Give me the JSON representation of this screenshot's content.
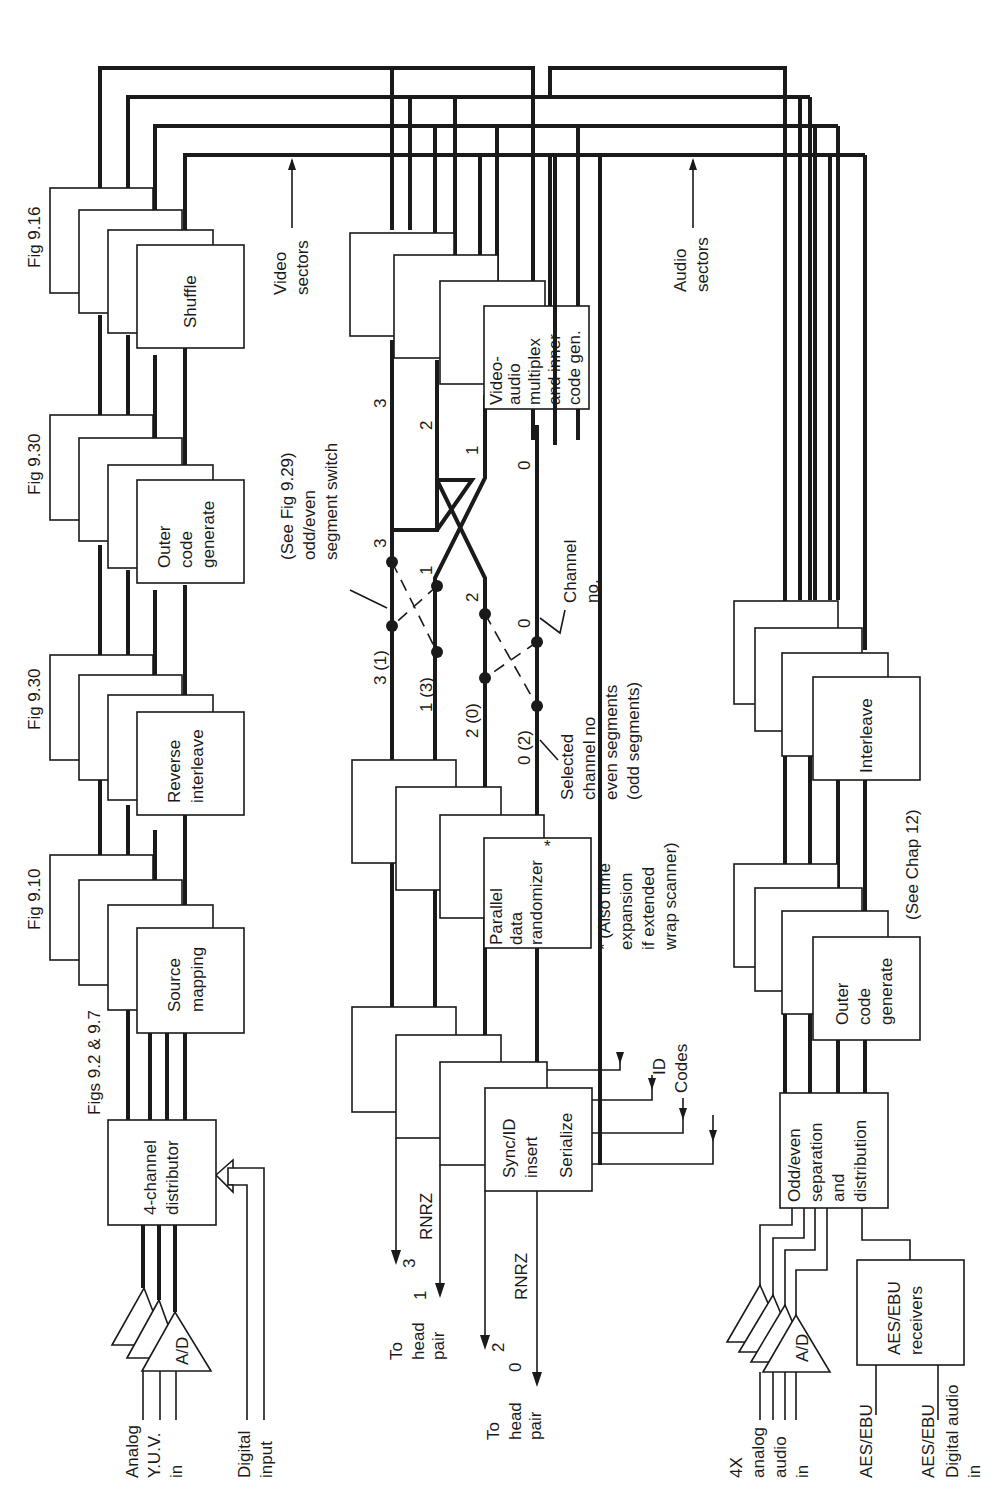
{
  "figure_refs": {
    "distributor": "Figs 9.2 & 9.7",
    "source_mapping": "Fig 9.10",
    "reverse_interleave": "Fig 9.30",
    "outer_code": "Fig 9.30",
    "shuffle": "Fig 9.16"
  },
  "video_chain": {
    "inputs": {
      "analog_line1": "Analog",
      "analog_line2": "Y.U.V.",
      "analog_line3": "in",
      "digital_line1": "Digital",
      "digital_line2": "input"
    },
    "adc_label": "A/D",
    "distributor": {
      "line1": "4-channel",
      "line2": "distributor"
    },
    "source_mapping": {
      "line1": "Source",
      "line2": "mapping"
    },
    "reverse_interleave": {
      "line1": "Reverse",
      "line2": "interleave"
    },
    "outer_code": {
      "line1": "Outer",
      "line2": "code",
      "line3": "generate"
    },
    "shuffle": {
      "line1": "Shuffle"
    },
    "sectors_line1": "Video",
    "sectors_line2": "sectors"
  },
  "record_chain": {
    "sync_box": {
      "line1": "Sync/ID",
      "line2": "insert",
      "line3": "Serialize"
    },
    "randomizer_box": {
      "line1": "Parallel",
      "line2": "data",
      "line3": "randomizer",
      "star": "*"
    },
    "randomizer_note": {
      "line1": "* (Also time",
      "line2": "expansion",
      "line3": "if extended",
      "line4": "wrap scanner)"
    },
    "mux_box": {
      "line1": "Video-",
      "line2": "audio",
      "line3": "multiplex",
      "line4": "and inner",
      "line5": "code gen."
    },
    "id_codes_line1": "ID",
    "id_codes_line2": "Codes",
    "switch_note": {
      "line1": "(See Fig 9.29)",
      "line2": "odd/even",
      "line3": "segment switch"
    },
    "channel_note": {
      "line1": "Channel",
      "line2": "no."
    },
    "selected_note": {
      "line1": "Selected",
      "line2": "channel no",
      "line3": "even segments",
      "line4": "(odd segments)"
    },
    "channel_labels_right": [
      "3",
      "2",
      "1",
      "0"
    ],
    "channel_labels_mid": [
      "3",
      "1",
      "2",
      "0"
    ],
    "channel_labels_left": [
      "3 (1)",
      "1 (3)",
      "2 (0)",
      "0 (2)"
    ],
    "outputs": {
      "rnrz_a": "RNRZ",
      "rnrz_b": "RNRZ",
      "ch3": "3",
      "ch1": "1",
      "ch2": "2",
      "ch0": "0",
      "head_a_line1": "To",
      "head_a_line2": "head",
      "head_a_line3": "pair",
      "head_b_line1": "To",
      "head_b_line2": "head",
      "head_b_line3": "pair"
    }
  },
  "audio_chain": {
    "inputs": {
      "analog_line1": "4X",
      "analog_line2": "analog",
      "analog_line3": "audio",
      "analog_line4": "in",
      "aes1": "AES/EBU",
      "aes2": "AES/EBU",
      "digital_line1": "Digital audio",
      "digital_line2": "in"
    },
    "adc_label": "A/D",
    "receivers": {
      "line1": "AES/EBU",
      "line2": "receivers"
    },
    "separation": {
      "line1": "Odd/even",
      "line2": "separation",
      "line3": "and",
      "line4": "distribution"
    },
    "outer_code": {
      "line1": "Outer",
      "line2": "code",
      "line3": "generate"
    },
    "interleave": {
      "line1": "Interleave"
    },
    "chapter_ref": "(See Chap 12)",
    "sectors_line1": "Audio",
    "sectors_line2": "sectors"
  }
}
